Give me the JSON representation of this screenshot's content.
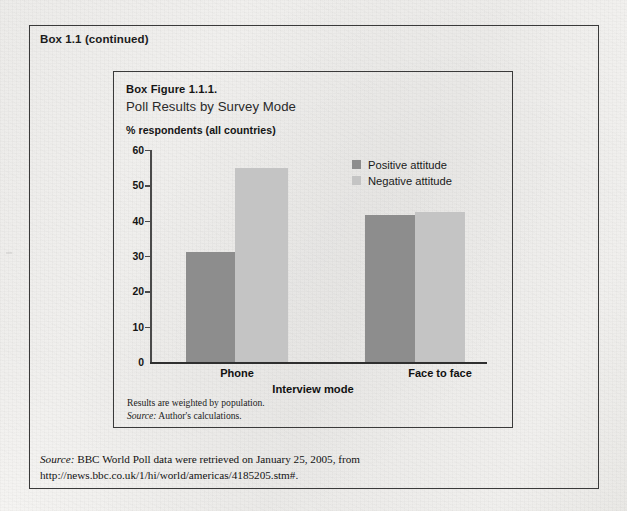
{
  "box": {
    "title": "Box 1.1 (continued)"
  },
  "figure": {
    "number": "Box Figure 1.1.1.",
    "title": "Poll Results by Survey Mode",
    "notes_line1": "Results are weighted by population.",
    "notes_source_word": "Source:",
    "notes_source_text": " Author's calculations."
  },
  "source_note": {
    "label": "Source:",
    "text": "  BBC World Poll data were retrieved on January 25, 2005, from http://news.bbc.co.uk/1/hi/world/americas/4185205.stm#."
  },
  "legend": {
    "items": [
      {
        "label": "Positive attitude",
        "color": "#8d8d8d",
        "name": "legend-positive"
      },
      {
        "label": "Negative attitude",
        "color": "#c4c4c4",
        "name": "legend-negative"
      }
    ]
  },
  "chart_data": {
    "type": "bar",
    "title": "Poll Results by Survey Mode",
    "subtitle": "Box Figure 1.1.1.",
    "categories": [
      "Phone",
      "Face to face"
    ],
    "series": [
      {
        "name": "Positive attitude",
        "values": [
          31,
          41.5
        ],
        "color": "#8d8d8d"
      },
      {
        "name": "Negative attitude",
        "values": [
          55,
          42.5
        ],
        "color": "#c4c4c4"
      }
    ],
    "xlabel": "Interview mode",
    "ylabel": "% respondents (all countries)",
    "ylim": [
      0,
      60
    ],
    "yticks": [
      0,
      10,
      20,
      30,
      40,
      50,
      60
    ],
    "ytick_labels": [
      "0",
      "10",
      "20",
      "30",
      "40",
      "50",
      "60"
    ],
    "grid": false,
    "legend_position": "top-right"
  }
}
